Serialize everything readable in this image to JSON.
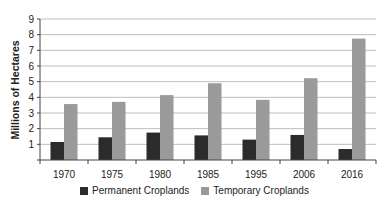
{
  "chart_data": {
    "type": "bar",
    "title": "",
    "xlabel": "",
    "ylabel": "Millions of Hectares",
    "ylim": [
      0,
      9
    ],
    "yticks": [
      1,
      2,
      3,
      4,
      5,
      6,
      7,
      8,
      9
    ],
    "grid": true,
    "legend_position": "bottom",
    "categories": [
      "1970",
      "1975",
      "1980",
      "1985",
      "1995",
      "2006",
      "2016"
    ],
    "series": [
      {
        "name": "Permanent Croplands",
        "color": "#2b2b2b",
        "values": [
          1.15,
          1.45,
          1.75,
          1.57,
          1.3,
          1.6,
          0.7
        ]
      },
      {
        "name": "Temporary Croplands",
        "color": "#9a9a9a",
        "values": [
          3.57,
          3.71,
          4.14,
          4.9,
          3.84,
          5.22,
          7.75
        ]
      }
    ]
  }
}
